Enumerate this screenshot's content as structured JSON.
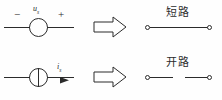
{
  "figure": {
    "background_color": "#fefefe",
    "stroke_color": "#2b2b2b",
    "width": 222,
    "height": 100
  },
  "rows": [
    {
      "id": "voltage-source-row",
      "source": {
        "type": "ideal-voltage-source",
        "symbol": "circle",
        "variable": "u",
        "subscript": "s",
        "polarity_left": "−",
        "polarity_right": "+"
      },
      "transform_arrow": {
        "name": "implies-arrow",
        "direction": "right",
        "style": "hollow-block"
      },
      "result": {
        "label": "短路",
        "meaning": "short-circuit",
        "terminals": 2,
        "wire": "continuous"
      }
    },
    {
      "id": "current-source-row",
      "source": {
        "type": "ideal-current-source",
        "symbol": "circle-with-vertical-bar",
        "variable": "i",
        "subscript": "s",
        "current_arrow_direction": "right"
      },
      "transform_arrow": {
        "name": "implies-arrow",
        "direction": "right",
        "style": "hollow-block"
      },
      "result": {
        "label": "开路",
        "meaning": "open-circuit",
        "terminals": 2,
        "wire": "broken"
      }
    }
  ]
}
